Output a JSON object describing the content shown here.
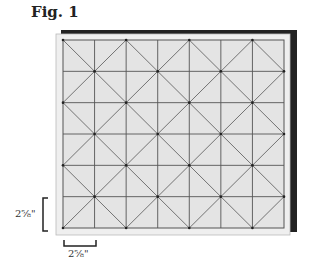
{
  "figure": {
    "title": "Fig. 1",
    "grid": {
      "columns": 7,
      "rows": 6,
      "pattern": "squares-with-diagonal-diamonds"
    },
    "colors": {
      "fill": "#e6e6e6",
      "frame": "#efefef",
      "shadow": "#222222",
      "lines": "#555555"
    },
    "dimensions": {
      "vertical_label": "2⅝\"",
      "horizontal_label": "2⅝\""
    }
  }
}
